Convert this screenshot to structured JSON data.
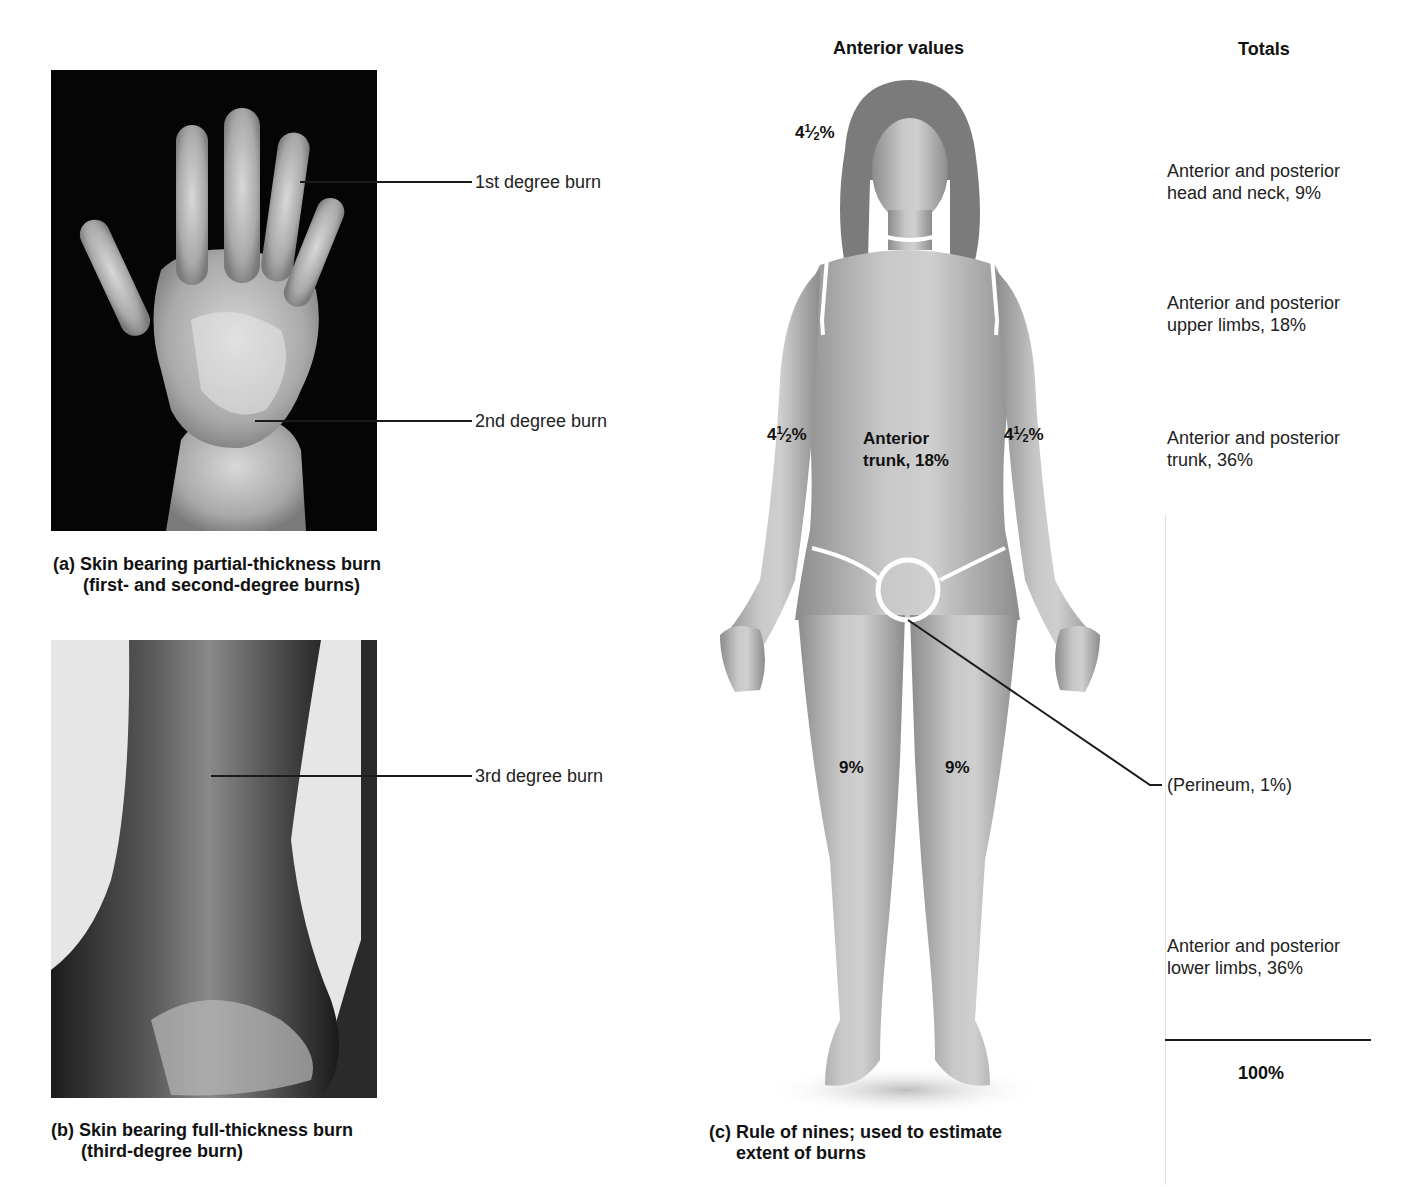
{
  "panel_a": {
    "labels": {
      "first_degree": "1st degree burn",
      "second_degree": "2nd degree burn"
    },
    "caption_line1": "(a) Skin bearing partial-thickness burn",
    "caption_line2": "(first- and second-degree burns)"
  },
  "panel_b": {
    "labels": {
      "third_degree": "3rd degree burn"
    },
    "caption_line1": "(b) Skin bearing full-thickness burn",
    "caption_line2": "(third-degree burn)"
  },
  "panel_c": {
    "header_anterior": "Anterior values",
    "header_totals": "Totals",
    "body_values": {
      "head": {
        "whole": "4",
        "num": "1",
        "den": "2",
        "suffix": "%"
      },
      "left_arm": {
        "whole": "4",
        "num": "1",
        "den": "2",
        "suffix": "%"
      },
      "right_arm": {
        "whole": "4",
        "num": "1",
        "den": "2",
        "suffix": "%"
      },
      "trunk_line1": "Anterior",
      "trunk_line2": "trunk, 18%",
      "left_leg": "9%",
      "right_leg": "9%"
    },
    "totals": {
      "head_neck_1": "Anterior and posterior",
      "head_neck_2": "head and neck, 9%",
      "upper_limbs_1": "Anterior and posterior",
      "upper_limbs_2": "upper limbs, 18%",
      "trunk_1": "Anterior and posterior",
      "trunk_2": "trunk, 36%",
      "perineum": "(Perineum, 1%)",
      "lower_limbs_1": "Anterior and posterior",
      "lower_limbs_2": "lower limbs, 36%",
      "grand_total": "100%"
    },
    "caption_line1": "(c) Rule of nines; used to estimate",
    "caption_line2": "extent of burns"
  }
}
